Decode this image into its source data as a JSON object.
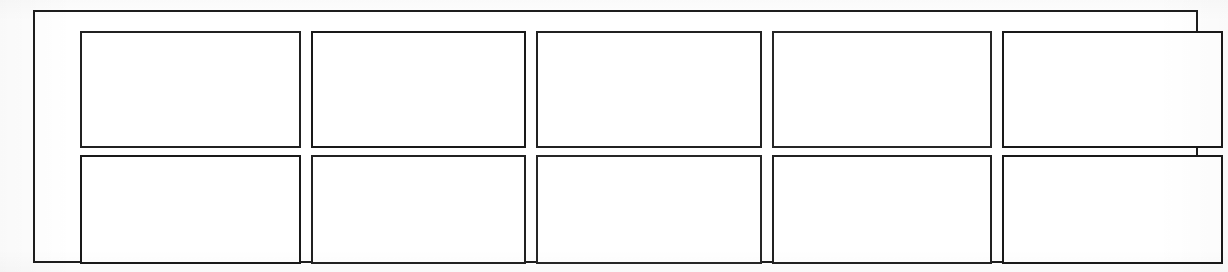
{
  "page": {
    "background_color": "#fefefe",
    "paper_color": "#ffffff",
    "ink_color": "#1d1d1d"
  },
  "frame": {
    "label": "outer-border",
    "border_color": "#1d1d1d",
    "border_width_px": 2
  },
  "grid": {
    "columns": 5,
    "rows": 2,
    "cell_border_color": "#1f1f1f",
    "cell_border_width_px": 2,
    "cell_fill": "#ffffff",
    "cells": [
      {
        "id": "r1c1",
        "row": 1,
        "column": 1,
        "text": ""
      },
      {
        "id": "r1c2",
        "row": 1,
        "column": 2,
        "text": ""
      },
      {
        "id": "r1c3",
        "row": 1,
        "column": 3,
        "text": ""
      },
      {
        "id": "r1c4",
        "row": 1,
        "column": 4,
        "text": ""
      },
      {
        "id": "r1c5",
        "row": 1,
        "column": 5,
        "text": ""
      },
      {
        "id": "r2c1",
        "row": 2,
        "column": 1,
        "text": ""
      },
      {
        "id": "r2c2",
        "row": 2,
        "column": 2,
        "text": ""
      },
      {
        "id": "r2c3",
        "row": 2,
        "column": 3,
        "text": ""
      },
      {
        "id": "r2c4",
        "row": 2,
        "column": 4,
        "text": ""
      },
      {
        "id": "r2c5",
        "row": 2,
        "column": 5,
        "text": ""
      }
    ]
  }
}
